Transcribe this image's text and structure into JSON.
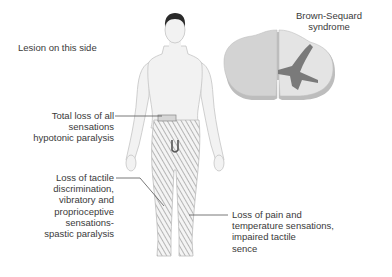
{
  "diagram": {
    "title": "Brown-Sequard syndrome",
    "title_lines": [
      "Brown-Sequard",
      "syndrome"
    ],
    "lesion_label": "Lesion on this side",
    "annotations": [
      {
        "id": "lesion-level",
        "lines": [
          "Total loss of all",
          "sensations",
          "hypotonic paralysis"
        ]
      },
      {
        "id": "ipsilateral-below",
        "lines": [
          "Loss of tactile",
          "discrimination,",
          "vibratory and",
          "proprioceptive",
          "sensations-",
          "spastic paralysis"
        ]
      },
      {
        "id": "contralateral-below",
        "lines": [
          "Loss of pain and",
          "temperature sensations,",
          "impaired tactile",
          "sence"
        ]
      }
    ],
    "colors": {
      "text": "#3a3a3a",
      "cord_white_matter": "#dcdcdc",
      "cord_outline": "#b8b8b8",
      "cord_lesion_half": "#cfcfcf",
      "gray_matter": "#7a7a7a",
      "skin": "#f2f2f2",
      "hatch": "#9a9a9a",
      "hair": "#2a2a2a"
    }
  }
}
